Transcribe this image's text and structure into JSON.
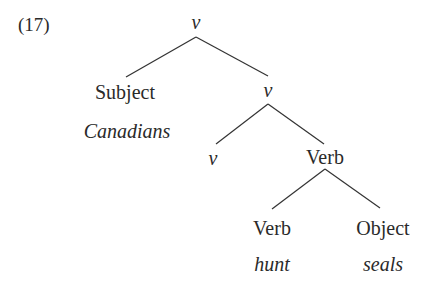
{
  "example_number": "(17)",
  "tree": {
    "root": {
      "label": "v",
      "italic": true
    },
    "subject": {
      "label": "Subject",
      "word": "Canadians"
    },
    "v_bar": {
      "label": "v",
      "italic": true
    },
    "v_head": {
      "label": "v",
      "italic": true
    },
    "verb_phrase": {
      "label": "Verb"
    },
    "verb": {
      "label": "Verb",
      "word": "hunt"
    },
    "object": {
      "label": "Object",
      "word": "seals"
    }
  },
  "edges": [
    [
      "root",
      "subject"
    ],
    [
      "root",
      "v_bar"
    ],
    [
      "v_bar",
      "v_head"
    ],
    [
      "v_bar",
      "verb_phrase"
    ],
    [
      "verb_phrase",
      "verb"
    ],
    [
      "verb_phrase",
      "object"
    ]
  ]
}
